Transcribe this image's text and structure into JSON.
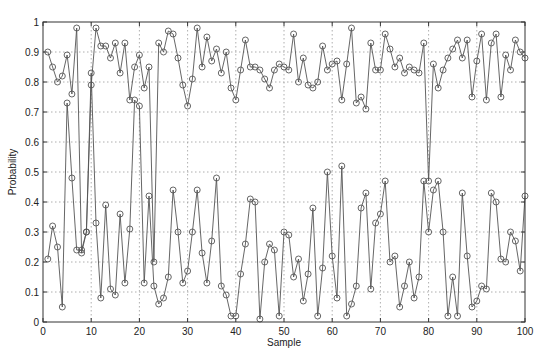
{
  "chart_data": {
    "type": "line",
    "title": "",
    "xlabel": "Sample",
    "ylabel": "Probability",
    "xlim": [
      0,
      100
    ],
    "ylim": [
      0,
      1
    ],
    "xticks": [
      0,
      10,
      20,
      30,
      40,
      50,
      60,
      70,
      80,
      90,
      100
    ],
    "yticks": [
      0,
      0.1,
      0.2,
      0.3,
      0.4,
      0.5,
      0.6,
      0.7,
      0.8,
      0.9,
      1
    ],
    "ytick_labels": [
      "0",
      "0.1",
      "0.2",
      "0.3",
      "0.4",
      "0.5",
      "0.6",
      "0.7",
      "0.8",
      "0.9",
      "1"
    ],
    "grid": true,
    "legend": null,
    "marker": "open-circle",
    "line_color": "#555555",
    "x": [
      1,
      2,
      3,
      4,
      5,
      6,
      7,
      8,
      9,
      10,
      11,
      12,
      13,
      14,
      15,
      16,
      17,
      18,
      19,
      20,
      21,
      22,
      23,
      24,
      25,
      26,
      27,
      28,
      29,
      30,
      31,
      32,
      33,
      34,
      35,
      36,
      37,
      38,
      39,
      40,
      41,
      42,
      43,
      44,
      45,
      46,
      47,
      48,
      49,
      50,
      51,
      52,
      53,
      54,
      55,
      56,
      57,
      58,
      59,
      60,
      61,
      62,
      63,
      64,
      65,
      66,
      67,
      68,
      69,
      70,
      71,
      72,
      73,
      74,
      75,
      76,
      77,
      78,
      79,
      80,
      81,
      82,
      83,
      84,
      85,
      86,
      87,
      88,
      89,
      90,
      91,
      92,
      93,
      94,
      95,
      96,
      97,
      98,
      99,
      100
    ],
    "series": [
      {
        "name": "High-probability series",
        "values": [
          0.9,
          0.85,
          0.8,
          0.82,
          0.89,
          0.76,
          0.98,
          0.23,
          0.3,
          0.79,
          0.98,
          0.92,
          0.92,
          0.88,
          0.93,
          0.83,
          0.93,
          0.74,
          0.85,
          0.89,
          0.78,
          0.85,
          0.2,
          0.93,
          0.9,
          0.97,
          0.96,
          0.88,
          0.79,
          0.72,
          0.81,
          0.98,
          0.85,
          0.95,
          0.87,
          0.91,
          0.83,
          0.9,
          0.78,
          0.74,
          0.84,
          0.94,
          0.85,
          0.85,
          0.84,
          0.81,
          0.78,
          0.84,
          0.86,
          0.85,
          0.84,
          0.96,
          0.8,
          0.88,
          0.79,
          0.78,
          0.8,
          0.92,
          0.84,
          0.86,
          0.87,
          0.74,
          0.86,
          0.98,
          0.73,
          0.75,
          0.71,
          0.93,
          0.84,
          0.84,
          0.96,
          0.91,
          0.85,
          0.88,
          0.83,
          0.85,
          0.84,
          0.83,
          0.93,
          0.47,
          0.86,
          0.78,
          0.84,
          0.88,
          0.91,
          0.94,
          0.88,
          0.94,
          0.75,
          0.87,
          0.96,
          0.74,
          0.93,
          0.96,
          0.75,
          0.89,
          0.84,
          0.94,
          0.9,
          0.88
        ]
      },
      {
        "name": "Low-probability series",
        "values": [
          0.21,
          0.32,
          0.25,
          0.05,
          0.73,
          0.48,
          0.24,
          0.24,
          0.3,
          0.83,
          0.33,
          0.08,
          0.39,
          0.11,
          0.09,
          0.36,
          0.13,
          0.31,
          0.74,
          0.72,
          0.13,
          0.42,
          0.12,
          0.06,
          0.08,
          0.15,
          0.44,
          0.3,
          0.13,
          0.17,
          0.3,
          0.44,
          0.23,
          0.13,
          0.27,
          0.48,
          0.12,
          0.09,
          0.02,
          0.02,
          0.16,
          0.26,
          0.41,
          0.4,
          0.01,
          0.2,
          0.26,
          0.24,
          0.02,
          0.3,
          0.29,
          0.15,
          0.21,
          0.07,
          0.16,
          0.38,
          0.02,
          0.18,
          0.5,
          0.22,
          0.08,
          0.52,
          0.02,
          0.06,
          0.12,
          0.38,
          0.43,
          0.11,
          0.33,
          0.36,
          0.47,
          0.2,
          0.22,
          0.05,
          0.12,
          0.2,
          0.08,
          0.15,
          0.47,
          0.3,
          0.44,
          0.47,
          0.3,
          0.02,
          0.15,
          0.02,
          0.43,
          0.22,
          0.05,
          0.07,
          0.12,
          0.11,
          0.43,
          0.4,
          0.21,
          0.2,
          0.3,
          0.27,
          0.17,
          0.42
        ]
      }
    ]
  },
  "axes": {
    "xlabel": "Sample",
    "ylabel": "Probability"
  }
}
